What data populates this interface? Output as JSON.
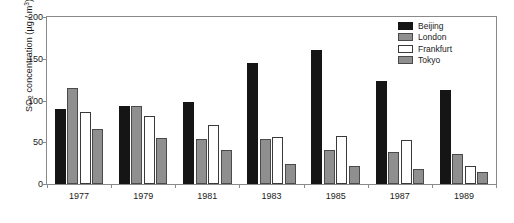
{
  "chart_data": {
    "type": "bar",
    "title": "",
    "xlabel": "",
    "ylabel": "SO2 concentration (µg / m3)",
    "ylabel_parts": {
      "prefix": "SO",
      "sub": "2",
      "middle": " concentration (µg / m",
      "sup": "3",
      "suffix": ")"
    },
    "categories": [
      "1977",
      "1979",
      "1981",
      "1983",
      "1985",
      "1987",
      "1989"
    ],
    "series": [
      {
        "name": "Beijing",
        "color": "#151515",
        "values": [
          90,
          94,
          98,
          145,
          160,
          123,
          113
        ]
      },
      {
        "name": "London",
        "color": "#8f8f8f",
        "values": [
          115,
          93,
          54,
          54,
          41,
          38,
          36
        ]
      },
      {
        "name": "Frankfurt",
        "color": "#ffffff",
        "values": [
          86,
          81,
          71,
          56,
          57,
          53,
          22
        ]
      },
      {
        "name": "Tokyo",
        "color": "#8f8f8f",
        "values": [
          66,
          55,
          41,
          24,
          22,
          18,
          14
        ]
      }
    ],
    "yticks": [
      0,
      50,
      100,
      150,
      200
    ],
    "ylim": [
      0,
      200
    ],
    "grid": false,
    "legend_position": "top-right",
    "legend_entries": [
      "Beijing",
      "London",
      "Frankfurt",
      "Tokyo"
    ]
  },
  "axes": {
    "y_title": "SO2 concentration (µg / m3)"
  }
}
